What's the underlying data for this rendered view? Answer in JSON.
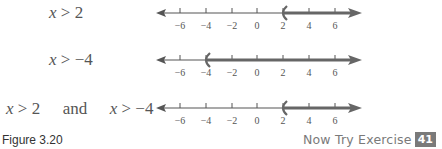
{
  "rows": [
    {
      "inequality_var": "x",
      "inequality_op": ">",
      "inequality_val": "2",
      "text": "x > 2",
      "boundary": 2,
      "direction": "right"
    },
    {
      "inequality_var": "x",
      "inequality_op": ">",
      "inequality_val": "−4",
      "text": "x > −4",
      "boundary": -4,
      "direction": "right"
    },
    {
      "text": "x > 2 and x > −4",
      "part1_var": "x",
      "part1_op": ">",
      "part1_val": "2",
      "conj": "and",
      "part2_var": "x",
      "part2_op": ">",
      "part2_val": "−4",
      "boundary": 2,
      "direction": "right"
    }
  ],
  "ticks": [
    "−6",
    "−4",
    "−2",
    "0",
    "2",
    "4",
    "6"
  ],
  "caption": "Figure 3.20",
  "now_try": {
    "label": "Now Try Exercise",
    "number": "41"
  },
  "colors": {
    "axis": "#555555",
    "shade": "#666666",
    "text": "#555555",
    "badge": "#7a7a7a"
  }
}
